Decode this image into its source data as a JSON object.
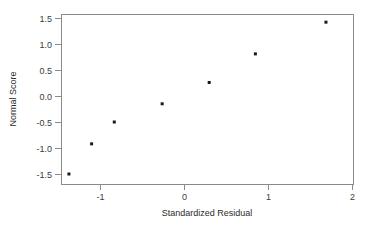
{
  "chart_data": {
    "type": "scatter",
    "title": "",
    "subtitle": "",
    "xlabel": "Standardized Residual",
    "ylabel": "Normal Score",
    "xlim": [
      -1.46,
      2.01
    ],
    "ylim": [
      -1.67,
      1.61
    ],
    "xticks": [
      -1,
      0,
      1,
      2
    ],
    "xticklabels": [
      "-1",
      "0",
      "1",
      "2"
    ],
    "yticks": [
      -1.5,
      -1.0,
      -0.5,
      0.0,
      0.5,
      1.0,
      1.5
    ],
    "yticklabels": [
      "-1.5",
      "-1.0",
      "-0.5",
      "0.0",
      "0.5",
      "1.0",
      "1.5"
    ],
    "grid": false,
    "legend": null,
    "legend_position": "none",
    "marker": "square",
    "marker_color": "#1a1a1a",
    "marker_size": 3,
    "frame_color": "#8a8a8a",
    "background_color": "#ffffff",
    "series": [
      {
        "name": "normal probability plot",
        "x": [
          -1.37,
          -1.1,
          -0.83,
          -0.26,
          0.3,
          0.85,
          1.69
        ],
        "y": [
          -1.5,
          -0.92,
          -0.5,
          -0.15,
          0.26,
          0.81,
          1.42
        ]
      }
    ],
    "points": [
      {
        "x": -1.37,
        "y": -1.5
      },
      {
        "x": -1.1,
        "y": -0.92
      },
      {
        "x": -0.83,
        "y": -0.5
      },
      {
        "x": -0.26,
        "y": -0.15
      },
      {
        "x": 0.3,
        "y": 0.26
      },
      {
        "x": 0.85,
        "y": 0.81
      },
      {
        "x": 1.69,
        "y": 1.42
      }
    ],
    "annotations": []
  },
  "geometry": {
    "plot_left": 61,
    "plot_right": 353,
    "plot_top": 14,
    "plot_bottom": 184,
    "x_px_per_unit": 84,
    "y_px_per_unit": 52,
    "x_zero_px": 184,
    "y_zero_px": 96
  }
}
